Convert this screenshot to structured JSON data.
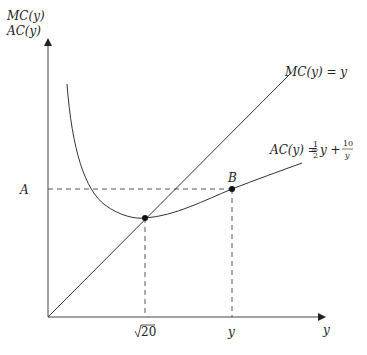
{
  "diagram": {
    "y_axis_label_line1": "MC(y)",
    "y_axis_label_line2": "AC(y)",
    "x_axis_label": "y",
    "mc_label": "MC(y) = y",
    "ac_label_prefix": "AC(y) = ",
    "ac_label_frac1_num": "1",
    "ac_label_frac1_den": "2",
    "ac_label_mid": "y + ",
    "ac_label_frac2_num": "10",
    "ac_label_frac2_den": "y",
    "point_a_label": "A",
    "point_b_label": "B",
    "tick_sqrt_label": "20",
    "tick_y_label": "y",
    "line_color": "#333333",
    "dash_color": "#444444"
  }
}
